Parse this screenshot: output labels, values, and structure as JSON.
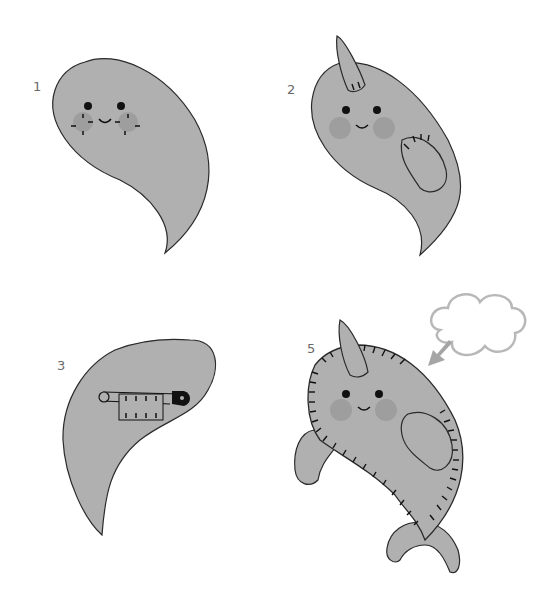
{
  "colors": {
    "body_fill": "#b0b0b0",
    "outline": "#2a2a2a",
    "cheek": "#9e9e9e",
    "cloud_stroke": "#b8b8b8",
    "arrow": "#a5a5a5",
    "label": "#6a6a6a"
  },
  "steps": [
    {
      "number": "1",
      "description": "Body piece with face: eyes, smile, dashed cheek markings"
    },
    {
      "number": "2",
      "description": "Horn and flipper patch added, rosy cheeks"
    },
    {
      "number": "3",
      "description": "Body piece with safety pin holding fabric"
    },
    {
      "number": "5",
      "description": "Finished narwhal with blanket-stitched edge, fins, tail and stuffing cloud"
    }
  ]
}
